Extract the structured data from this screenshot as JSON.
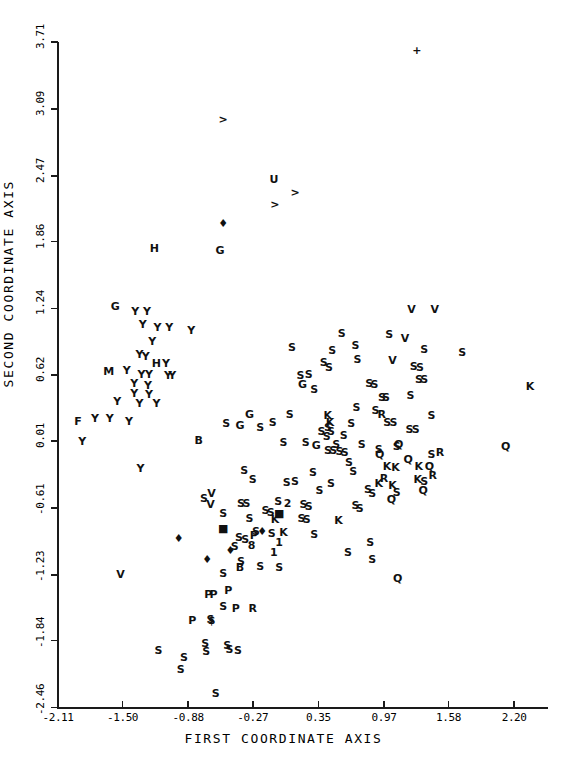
{
  "chart_data": {
    "type": "scatter",
    "title": "",
    "xlabel": "FIRST COORDINATE AXIS",
    "ylabel": "SECOND COORDINATE AXIS",
    "xlim": [
      -2.11,
      2.52
    ],
    "ylim": [
      -2.46,
      3.71
    ],
    "xticks": [
      "-2.11",
      "-1.50",
      "-0.88",
      "-0.27",
      "0.35",
      "0.97",
      "1.58",
      "2.20"
    ],
    "xtick_values": [
      -2.11,
      -1.5,
      -0.88,
      -0.27,
      0.35,
      0.97,
      1.58,
      2.2
    ],
    "yticks": [
      "3.71",
      "3.09",
      "2.47",
      "1.86",
      "1.24",
      "0.62",
      "0.01",
      "-0.61",
      "-1.23",
      "-1.84",
      "-2.46"
    ],
    "ytick_values": [
      3.71,
      3.09,
      2.47,
      1.86,
      1.24,
      0.62,
      0.01,
      -0.61,
      -1.23,
      -1.84,
      -2.46
    ],
    "grid": false,
    "legend": "none",
    "marker_style": "text-labels",
    "point_count": 196,
    "points": [
      {
        "label": "+",
        "x": 1.28,
        "y": 3.64
      },
      {
        "label": ">",
        "x": -0.55,
        "y": 3.0
      },
      {
        "label": "U",
        "x": -0.07,
        "y": 2.44
      },
      {
        "label": ">",
        "x": 0.13,
        "y": 2.32
      },
      {
        "label": ">",
        "x": -0.06,
        "y": 2.21
      },
      {
        "label": "♦",
        "x": -0.55,
        "y": 2.03
      },
      {
        "label": "H",
        "x": -1.2,
        "y": 1.8
      },
      {
        "label": "G",
        "x": -0.58,
        "y": 1.78
      },
      {
        "label": "G",
        "x": -1.57,
        "y": 1.26
      },
      {
        "label": "Y",
        "x": -1.38,
        "y": 1.22
      },
      {
        "label": "Y",
        "x": -1.27,
        "y": 1.22
      },
      {
        "label": "V",
        "x": 1.23,
        "y": 1.23
      },
      {
        "label": "V",
        "x": 1.45,
        "y": 1.23
      },
      {
        "label": "Y",
        "x": -1.31,
        "y": 1.1
      },
      {
        "label": "Y",
        "x": -1.17,
        "y": 1.07
      },
      {
        "label": "Y",
        "x": -1.06,
        "y": 1.07
      },
      {
        "label": "Y",
        "x": -0.85,
        "y": 1.04
      },
      {
        "label": "Y",
        "x": -1.22,
        "y": 0.94
      },
      {
        "label": "S",
        "x": 0.7,
        "y": 0.9
      },
      {
        "label": "S",
        "x": 1.35,
        "y": 0.86
      },
      {
        "label": "S",
        "x": 1.71,
        "y": 0.84
      },
      {
        "label": "Y",
        "x": -1.34,
        "y": 0.82
      },
      {
        "label": "Y",
        "x": -1.28,
        "y": 0.8
      },
      {
        "label": "S",
        "x": 0.72,
        "y": 0.77
      },
      {
        "label": "V",
        "x": 1.05,
        "y": 0.76
      },
      {
        "label": "H",
        "x": -1.18,
        "y": 0.73
      },
      {
        "label": "Y",
        "x": -1.09,
        "y": 0.73
      },
      {
        "label": "S",
        "x": 1.25,
        "y": 0.71
      },
      {
        "label": "S",
        "x": 1.31,
        "y": 0.7
      },
      {
        "label": "M",
        "x": -1.63,
        "y": 0.66
      },
      {
        "label": "Y",
        "x": -1.46,
        "y": 0.67
      },
      {
        "label": "Y",
        "x": -1.32,
        "y": 0.63
      },
      {
        "label": "Y",
        "x": -1.25,
        "y": 0.63
      },
      {
        "label": "Y",
        "x": -1.07,
        "y": 0.62
      },
      {
        "label": "Y",
        "x": -1.03,
        "y": 0.62
      },
      {
        "label": "S",
        "x": 1.3,
        "y": 0.59
      },
      {
        "label": "S",
        "x": 1.35,
        "y": 0.59
      },
      {
        "label": "Y",
        "x": -1.39,
        "y": 0.55
      },
      {
        "label": "Y",
        "x": -1.26,
        "y": 0.53
      },
      {
        "label": "K",
        "x": 2.35,
        "y": 0.52
      },
      {
        "label": "Y",
        "x": -1.39,
        "y": 0.46
      },
      {
        "label": "Y",
        "x": -1.25,
        "y": 0.45
      },
      {
        "label": "S",
        "x": 1.22,
        "y": 0.44
      },
      {
        "label": "Y",
        "x": -1.55,
        "y": 0.38
      },
      {
        "label": "Y",
        "x": -1.34,
        "y": 0.36
      },
      {
        "label": "Y",
        "x": -1.18,
        "y": 0.36
      },
      {
        "label": "G",
        "x": -0.3,
        "y": 0.26
      },
      {
        "label": "S",
        "x": 0.08,
        "y": 0.26
      },
      {
        "label": "R",
        "x": 0.95,
        "y": 0.26
      },
      {
        "label": "S",
        "x": 1.42,
        "y": 0.25
      },
      {
        "label": "F",
        "x": -1.92,
        "y": 0.2
      },
      {
        "label": "Y",
        "x": -1.76,
        "y": 0.22
      },
      {
        "label": "Y",
        "x": -1.62,
        "y": 0.22
      },
      {
        "label": "Y",
        "x": -1.44,
        "y": 0.2
      },
      {
        "label": "G",
        "x": -0.39,
        "y": 0.16
      },
      {
        "label": "S",
        "x": -0.2,
        "y": 0.14
      },
      {
        "label": "K",
        "x": 0.46,
        "y": 0.19
      },
      {
        "label": "S",
        "x": 0.66,
        "y": 0.18
      },
      {
        "label": "S",
        "x": 1.21,
        "y": 0.12
      },
      {
        "label": "S",
        "x": 1.27,
        "y": 0.12
      },
      {
        "label": "S",
        "x": 0.38,
        "y": 0.1
      },
      {
        "label": "S",
        "x": 0.43,
        "y": 0.06
      },
      {
        "label": "S",
        "x": 0.59,
        "y": 0.07
      },
      {
        "label": "Y",
        "x": -1.88,
        "y": 0.01
      },
      {
        "label": "B",
        "x": -0.78,
        "y": 0.02
      },
      {
        "label": "S",
        "x": 0.02,
        "y": 0.0
      },
      {
        "label": "S",
        "x": 0.23,
        "y": 0.0
      },
      {
        "label": "G",
        "x": 0.33,
        "y": -0.03
      },
      {
        "label": "S",
        "x": 0.52,
        "y": -0.02
      },
      {
        "label": "S",
        "x": 0.76,
        "y": -0.02
      },
      {
        "label": "Q",
        "x": 1.11,
        "y": -0.02
      },
      {
        "label": "S",
        "x": 1.09,
        "y": -0.04
      },
      {
        "label": "Q",
        "x": 2.12,
        "y": -0.04
      },
      {
        "label": "S",
        "x": 0.44,
        "y": -0.07
      },
      {
        "label": "S",
        "x": 0.49,
        "y": -0.07
      },
      {
        "label": "S",
        "x": 0.55,
        "y": -0.08
      },
      {
        "label": "S",
        "x": 0.6,
        "y": -0.09
      },
      {
        "label": "R",
        "x": 1.5,
        "y": -0.09
      },
      {
        "label": "S",
        "x": 1.42,
        "y": -0.11
      },
      {
        "label": "Q",
        "x": 1.2,
        "y": -0.16
      },
      {
        "label": "S",
        "x": 0.64,
        "y": -0.18
      },
      {
        "label": "K",
        "x": 1.0,
        "y": -0.22
      },
      {
        "label": "K",
        "x": 1.08,
        "y": -0.23
      },
      {
        "label": "K",
        "x": 1.3,
        "y": -0.22
      },
      {
        "label": "Q",
        "x": 1.4,
        "y": -0.22
      },
      {
        "label": "Y",
        "x": -1.33,
        "y": -0.24
      },
      {
        "label": "S",
        "x": -0.35,
        "y": -0.26
      },
      {
        "label": "S",
        "x": 0.3,
        "y": -0.28
      },
      {
        "label": "S",
        "x": 0.68,
        "y": -0.27
      },
      {
        "label": "R",
        "x": 1.43,
        "y": -0.3
      },
      {
        "label": "K",
        "x": 1.29,
        "y": -0.34
      },
      {
        "label": "S",
        "x": 1.35,
        "y": -0.36
      },
      {
        "label": "S",
        "x": 0.05,
        "y": -0.37
      },
      {
        "label": "S",
        "x": 0.47,
        "y": -0.38
      },
      {
        "label": "Q",
        "x": 1.34,
        "y": -0.44
      },
      {
        "label": "V",
        "x": -0.66,
        "y": -0.47
      },
      {
        "label": "S",
        "x": -0.73,
        "y": -0.52
      },
      {
        "label": "V",
        "x": -0.67,
        "y": -0.57
      },
      {
        "label": "S",
        "x": -0.38,
        "y": -0.56
      },
      {
        "label": "S",
        "x": -0.33,
        "y": -0.56
      },
      {
        "label": "S",
        "x": -0.03,
        "y": -0.55
      },
      {
        "label": "2",
        "x": 0.06,
        "y": -0.56
      },
      {
        "label": "S",
        "x": 0.21,
        "y": -0.57
      },
      {
        "label": "S",
        "x": 0.26,
        "y": -0.59
      },
      {
        "label": "S",
        "x": 0.7,
        "y": -0.58
      },
      {
        "label": "S",
        "x": 0.74,
        "y": -0.61
      },
      {
        "label": "S",
        "x": -0.15,
        "y": -0.63
      },
      {
        "label": "S",
        "x": -0.1,
        "y": -0.65
      },
      {
        "label": "■",
        "x": -0.02,
        "y": -0.66
      },
      {
        "label": "K",
        "x": -0.06,
        "y": -0.71
      },
      {
        "label": "K",
        "x": 0.54,
        "y": -0.72
      },
      {
        "label": "■",
        "x": -0.55,
        "y": -0.8
      },
      {
        "label": "S",
        "x": -0.24,
        "y": -0.82
      },
      {
        "label": "♦",
        "x": -0.18,
        "y": -0.82
      },
      {
        "label": "S",
        "x": -0.09,
        "y": -0.84
      },
      {
        "label": "K",
        "x": 0.02,
        "y": -0.83
      },
      {
        "label": "S",
        "x": 0.31,
        "y": -0.85
      },
      {
        "label": "S",
        "x": -0.4,
        "y": -0.88
      },
      {
        "label": "S",
        "x": -0.34,
        "y": -0.9
      },
      {
        "label": "1",
        "x": -0.02,
        "y": -0.93
      },
      {
        "label": "♦",
        "x": -0.97,
        "y": -0.89
      },
      {
        "label": "S",
        "x": -0.44,
        "y": -0.96
      },
      {
        "label": "♦",
        "x": -0.48,
        "y": -1.0
      },
      {
        "label": "1",
        "x": -0.07,
        "y": -1.02
      },
      {
        "label": "S",
        "x": 0.63,
        "y": -1.02
      },
      {
        "label": "S",
        "x": -0.38,
        "y": -1.1
      },
      {
        "label": "B",
        "x": -0.39,
        "y": -1.16
      },
      {
        "label": "S",
        "x": -0.2,
        "y": -1.15
      },
      {
        "label": "S",
        "x": -0.02,
        "y": -1.16
      },
      {
        "label": "♦",
        "x": -0.7,
        "y": -1.08
      },
      {
        "label": "V",
        "x": -1.52,
        "y": -1.22
      },
      {
        "label": "Q",
        "x": 1.1,
        "y": -1.26
      },
      {
        "label": "P",
        "x": -0.69,
        "y": -1.41
      },
      {
        "label": "P",
        "x": -0.64,
        "y": -1.41
      },
      {
        "label": "P",
        "x": -0.5,
        "y": -1.37
      },
      {
        "label": "S",
        "x": -0.55,
        "y": -1.52
      },
      {
        "label": "P",
        "x": -0.43,
        "y": -1.54
      },
      {
        "label": "R",
        "x": -0.27,
        "y": -1.54
      },
      {
        "label": "P",
        "x": -0.84,
        "y": -1.65
      },
      {
        "label": "S",
        "x": -0.67,
        "y": -1.64
      },
      {
        "label": "$",
        "x": -0.66,
        "y": -1.65
      },
      {
        "label": "S",
        "x": -0.72,
        "y": -1.86
      },
      {
        "label": "S",
        "x": -0.71,
        "y": -1.94
      },
      {
        "label": "S",
        "x": -0.51,
        "y": -1.88
      },
      {
        "label": "S",
        "x": -0.49,
        "y": -1.92
      },
      {
        "label": "S",
        "x": -0.41,
        "y": -1.93
      },
      {
        "label": "S",
        "x": -1.16,
        "y": -1.93
      },
      {
        "label": "S",
        "x": -0.92,
        "y": -1.99
      },
      {
        "label": "S",
        "x": -0.95,
        "y": -2.1
      },
      {
        "label": "S",
        "x": -0.62,
        "y": -2.33
      },
      {
        "label": "S",
        "x": 0.57,
        "y": 1.01
      },
      {
        "label": "S",
        "x": 0.48,
        "y": 0.85
      },
      {
        "label": "S",
        "x": 0.4,
        "y": 0.74
      },
      {
        "label": "S",
        "x": 0.45,
        "y": 0.7
      },
      {
        "label": "S",
        "x": 0.18,
        "y": 0.62
      },
      {
        "label": "S",
        "x": 0.26,
        "y": 0.63
      },
      {
        "label": "G",
        "x": 0.2,
        "y": 0.54
      },
      {
        "label": "S",
        "x": 0.31,
        "y": 0.49
      },
      {
        "label": "S",
        "x": 0.1,
        "y": 0.88
      },
      {
        "label": "K",
        "x": 0.44,
        "y": 0.25
      },
      {
        "label": "S",
        "x": 0.44,
        "y": 0.14
      },
      {
        "label": "S",
        "x": 0.47,
        "y": 0.1
      },
      {
        "label": "S",
        "x": -0.08,
        "y": 0.19
      },
      {
        "label": "S",
        "x": 0.71,
        "y": 0.33
      },
      {
        "label": "S",
        "x": 1.0,
        "y": 0.19
      },
      {
        "label": "S",
        "x": 1.06,
        "y": 0.19
      },
      {
        "label": "S",
        "x": 0.82,
        "y": -0.43
      },
      {
        "label": "S",
        "x": 0.86,
        "y": -0.47
      },
      {
        "label": "Q",
        "x": 0.93,
        "y": -0.11
      },
      {
        "label": "S",
        "x": 0.92,
        "y": -0.06
      },
      {
        "label": "R",
        "x": 0.97,
        "y": -0.33
      },
      {
        "label": "K",
        "x": 0.92,
        "y": -0.38
      },
      {
        "label": "K",
        "x": 1.05,
        "y": -0.4
      },
      {
        "label": "S",
        "x": 1.09,
        "y": -0.46
      },
      {
        "label": "Q",
        "x": 1.04,
        "y": -0.53
      },
      {
        "label": "S",
        "x": 0.83,
        "y": 0.55
      },
      {
        "label": "S",
        "x": 0.88,
        "y": 0.54
      },
      {
        "label": "S",
        "x": 0.95,
        "y": 0.42
      },
      {
        "label": "S",
        "x": 0.99,
        "y": 0.42
      },
      {
        "label": "S",
        "x": 0.89,
        "y": 0.3
      },
      {
        "label": "V",
        "x": 1.17,
        "y": 0.97
      },
      {
        "label": "S",
        "x": 1.02,
        "y": 1.0
      },
      {
        "label": "S",
        "x": -0.52,
        "y": 0.18
      },
      {
        "label": "S",
        "x": 0.13,
        "y": -0.36
      },
      {
        "label": "S",
        "x": 0.36,
        "y": -0.44
      },
      {
        "label": "S",
        "x": -0.27,
        "y": -0.34
      },
      {
        "label": "S",
        "x": 0.19,
        "y": -0.7
      },
      {
        "label": "S",
        "x": 0.24,
        "y": -0.71
      },
      {
        "label": "S",
        "x": -0.3,
        "y": -0.7
      },
      {
        "label": "S",
        "x": -0.55,
        "y": -0.66
      },
      {
        "label": "P",
        "x": -0.26,
        "y": -0.86
      },
      {
        "label": "8",
        "x": -0.28,
        "y": -0.95
      },
      {
        "label": "S",
        "x": -0.55,
        "y": -1.21
      },
      {
        "label": "S",
        "x": 0.84,
        "y": -0.93
      },
      {
        "label": "S",
        "x": 0.86,
        "y": -1.08
      }
    ]
  }
}
